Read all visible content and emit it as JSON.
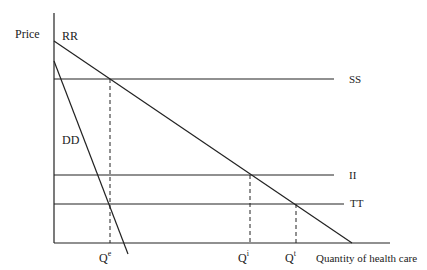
{
  "axes": {
    "y_label": "Price",
    "x_label": "Quantity of health care"
  },
  "curves": {
    "rr": "RR",
    "dd": "DD",
    "ss": "SS",
    "ii": "II",
    "tt": "TT"
  },
  "quantities": {
    "qe": {
      "base": "Q",
      "sup": "e"
    },
    "qi": {
      "base": "Q",
      "sup": "i"
    },
    "qt": {
      "base": "Q",
      "sup": "t"
    }
  }
}
